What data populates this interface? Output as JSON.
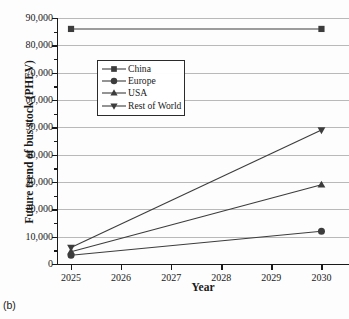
{
  "panel_tag": "(b)",
  "chart_data": {
    "type": "line",
    "title": "",
    "xlabel": "Year",
    "ylabel": "Future trend of bus stock (PHEV)",
    "x": [
      2025,
      2026,
      2027,
      2028,
      2029,
      2030
    ],
    "xtick_labels": [
      "2025",
      "2026",
      "2027",
      "2028",
      "2029",
      "2030"
    ],
    "xlim": [
      2024.72,
      2030.55
    ],
    "ylim": [
      0,
      90000
    ],
    "ytick_labels": [
      "0",
      "10,000",
      "20,000",
      "30,000",
      "40,000",
      "50,000",
      "60,000",
      "70,000",
      "80,000",
      "90,000"
    ],
    "ytick_values": [
      0,
      10000,
      20000,
      30000,
      40000,
      50000,
      60000,
      70000,
      80000,
      90000
    ],
    "grid": "horizontal",
    "legend_position": "upper-left-inside",
    "series": [
      {
        "name": "China",
        "marker": "square",
        "color": "#3c3c3c",
        "x": [
          2025,
          2030
        ],
        "values": [
          86000,
          86000
        ]
      },
      {
        "name": "Europe",
        "marker": "circle",
        "color": "#3c3c3c",
        "x": [
          2025,
          2030
        ],
        "values": [
          3200,
          12000
        ]
      },
      {
        "name": "USA",
        "marker": "triangle-up",
        "color": "#3c3c3c",
        "x": [
          2025,
          2030
        ],
        "values": [
          4500,
          29000
        ]
      },
      {
        "name": "Rest of World",
        "marker": "triangle-down",
        "color": "#3c3c3c",
        "x": [
          2025,
          2030
        ],
        "values": [
          6000,
          49000
        ]
      }
    ]
  },
  "legend": {
    "items": [
      {
        "label": "China",
        "marker": "square"
      },
      {
        "label": "Europe",
        "marker": "circle"
      },
      {
        "label": "USA",
        "marker": "triangle-up"
      },
      {
        "label": "Rest of World",
        "marker": "triangle-down"
      }
    ]
  },
  "colors": {
    "series": "#3c3c3c",
    "grid": "#b9b9b9",
    "axis": "#1a1a1a",
    "background": "#fdfdfd"
  }
}
